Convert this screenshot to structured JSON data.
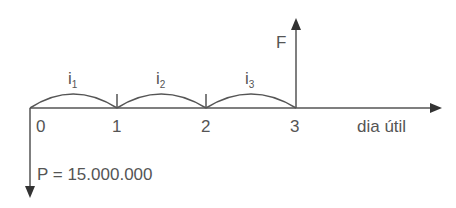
{
  "diagram": {
    "title": "",
    "axis_label": "dia útil",
    "ticks": [
      "0",
      "1",
      "2",
      "3"
    ],
    "rates": [
      {
        "base": "i",
        "sub": "1"
      },
      {
        "base": "i",
        "sub": "2"
      },
      {
        "base": "i",
        "sub": "3"
      }
    ],
    "future_value_label": "F",
    "present_value_label": "P = 15.000.000",
    "line_color": "#555555"
  }
}
